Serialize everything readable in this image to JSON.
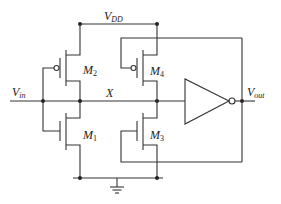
{
  "diagram": {
    "type": "circuit-schematic",
    "labels": {
      "vdd": {
        "main": "V",
        "sub": "DD"
      },
      "vin": {
        "main": "V",
        "sub": "in"
      },
      "vout": {
        "main": "V",
        "sub": "out"
      },
      "x_node": "X",
      "m1": {
        "main": "M",
        "sub": "1"
      },
      "m2": {
        "main": "M",
        "sub": "2"
      },
      "m3": {
        "main": "M",
        "sub": "3"
      },
      "m4": {
        "main": "M",
        "sub": "4"
      }
    },
    "components": [
      {
        "id": "M1",
        "type": "nmos",
        "gate": "Vin",
        "drain": "X",
        "source": "GND"
      },
      {
        "id": "M2",
        "type": "pmos",
        "gate": "Vin",
        "drain": "X",
        "source": "VDD"
      },
      {
        "id": "M3",
        "type": "nmos",
        "gate": "Vout",
        "drain": "X",
        "source": "GND"
      },
      {
        "id": "M4",
        "type": "pmos",
        "gate": "Vout",
        "drain": "X",
        "source": "VDD"
      },
      {
        "id": "INV",
        "type": "inverter",
        "input": "X",
        "output": "Vout"
      }
    ],
    "colors": {
      "wire": "#333333",
      "background": "#ffffff"
    }
  }
}
